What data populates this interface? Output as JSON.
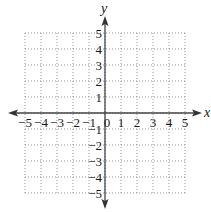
{
  "chart_data": {
    "type": "scatter",
    "title": "",
    "xlabel": "x",
    "ylabel": "y",
    "xlim": [
      -5,
      5
    ],
    "ylim": [
      -5,
      5
    ],
    "grid": true,
    "grid_style": "dotted",
    "x_ticks": [
      -5,
      -4,
      -3,
      -2,
      -1,
      0,
      1,
      2,
      3,
      4,
      5
    ],
    "y_ticks": [
      -5,
      -4,
      -3,
      -2,
      -1,
      1,
      2,
      3,
      4,
      5
    ],
    "x_tick_labels": [
      "−5",
      "−4",
      "−3",
      "−2",
      "−1",
      "0",
      "1",
      "2",
      "3",
      "4",
      "5"
    ],
    "y_tick_labels": [
      "−5",
      "−4",
      "−3",
      "−2",
      "−1",
      "1",
      "2",
      "3",
      "4",
      "5"
    ],
    "series": [],
    "legend": null
  },
  "colors": {
    "axis": "#444444",
    "grid": "#8a8a8a",
    "text": "#1a1a1a"
  }
}
